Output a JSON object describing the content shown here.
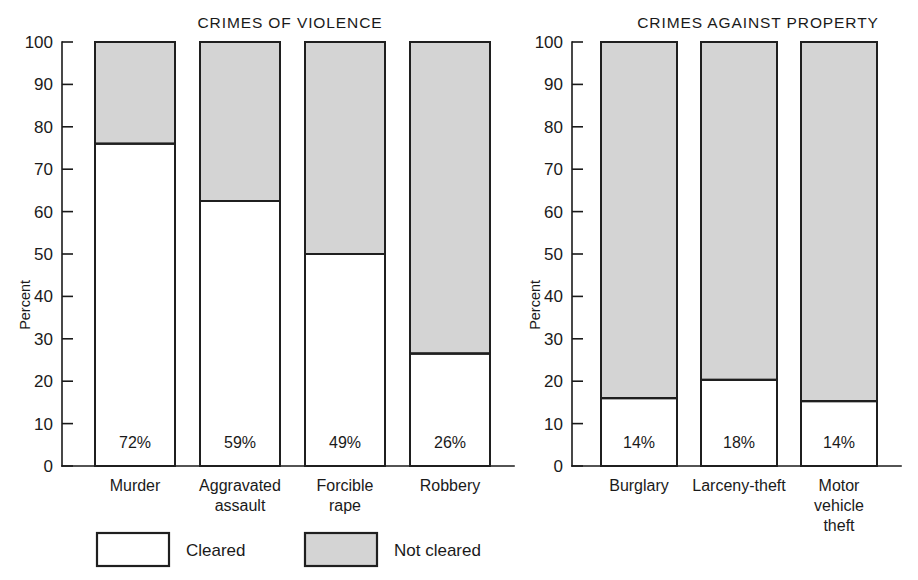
{
  "figure": {
    "axis_label": "Percent",
    "legend": [
      {
        "key": "cleared",
        "label": "Cleared",
        "swatch": "#ffffff"
      },
      {
        "key": "not_cleared",
        "label": "Not cleared",
        "swatch": "#d4d4d4"
      }
    ]
  },
  "chart_data": [
    {
      "type": "bar",
      "subtype": "stacked-100-percent",
      "title": "CRIMES OF VIOLENCE",
      "xlabel": "",
      "ylabel": "Percent",
      "ylim": [
        0,
        100
      ],
      "yticks": [
        0,
        10,
        20,
        30,
        40,
        50,
        60,
        70,
        80,
        90,
        100
      ],
      "ytick_labels": [
        "0",
        "10",
        "20",
        "30",
        "40",
        "50",
        "60",
        "70",
        "80",
        "90",
        "100"
      ],
      "grid": false,
      "legend_position": "bottom",
      "categories": [
        "Murder",
        "Aggravated assault",
        "Forcible rape",
        "Robbery"
      ],
      "category_lines": [
        [
          "Murder"
        ],
        [
          "Aggravated",
          "assault"
        ],
        [
          "Forcible",
          "rape"
        ],
        [
          "Robbery"
        ]
      ],
      "series": [
        {
          "name": "Cleared",
          "values": [
            76,
            62.5,
            50,
            26.5
          ]
        },
        {
          "name": "Not cleared",
          "values": [
            24,
            37.5,
            50,
            73.5
          ]
        }
      ],
      "data_labels": [
        "72%",
        "59%",
        "49%",
        "26%"
      ]
    },
    {
      "type": "bar",
      "subtype": "stacked-100-percent",
      "title": "CRIMES AGAINST PROPERTY",
      "xlabel": "",
      "ylabel": "Percent",
      "ylim": [
        0,
        100
      ],
      "yticks": [
        0,
        10,
        20,
        30,
        40,
        50,
        60,
        70,
        80,
        90,
        100
      ],
      "ytick_labels": [
        "0",
        "10",
        "20",
        "30",
        "40",
        "50",
        "60",
        "70",
        "80",
        "90",
        "100"
      ],
      "grid": false,
      "legend_position": "bottom",
      "categories": [
        "Burglary",
        "Larceny-theft",
        "Motor vehicle theft"
      ],
      "category_lines": [
        [
          "Burglary"
        ],
        [
          "Larceny-theft"
        ],
        [
          "Motor",
          "vehicle",
          "theft"
        ]
      ],
      "series": [
        {
          "name": "Cleared",
          "values": [
            16,
            20.3,
            15.3
          ]
        },
        {
          "name": "Not cleared",
          "values": [
            84,
            79.7,
            84.7
          ]
        }
      ],
      "data_labels": [
        "14%",
        "18%",
        "14%"
      ]
    }
  ]
}
